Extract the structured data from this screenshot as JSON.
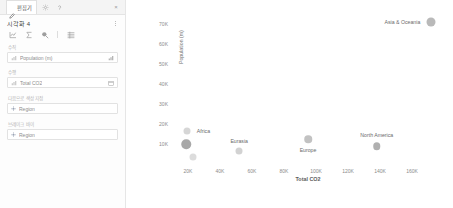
{
  "panel": {
    "tabs": [
      {
        "id": "editor",
        "label": "편집기",
        "icon": "pencil-icon"
      }
    ],
    "tab_buttons": [
      {
        "id": "settings",
        "icon": "gear-icon"
      },
      {
        "id": "help",
        "icon": "question-icon"
      }
    ],
    "close_label": "×",
    "viz_title": "시각화 4",
    "kebab_name": "more-options",
    "tools": [
      {
        "id": "chart-type",
        "icon": "line-chart-icon"
      },
      {
        "id": "aggregate",
        "icon": "sigma-icon"
      },
      {
        "id": "format",
        "icon": "paint-icon"
      },
      {
        "id": "table-view",
        "icon": "table-icon"
      }
    ],
    "fields": [
      {
        "section": "vertical",
        "label": "수직",
        "value": "Population (m)",
        "field_icon": "measure-icon",
        "action_icon": "sort-icon"
      },
      {
        "section": "horizontal",
        "label": "수평",
        "value": "Total CO2",
        "field_icon": "measure-icon",
        "action_icon": "calendar-icon"
      },
      {
        "section": "color-by",
        "label": "다음으로 색상 지정",
        "value": "Region",
        "field_icon": "dimension-icon",
        "action_icon": ""
      },
      {
        "section": "break-by",
        "label": "브레이크 바이",
        "value": "Region",
        "field_icon": "dimension-icon",
        "action_icon": ""
      }
    ]
  },
  "chart_data": {
    "type": "scatter",
    "title": "",
    "xlabel": "Total CO2",
    "ylabel": "Population (m)",
    "xlim": [
      10000,
      180000
    ],
    "ylim": [
      0,
      75000
    ],
    "xticks": [
      "20K",
      "40K",
      "60K",
      "80K",
      "100K",
      "120K",
      "140K",
      "160K"
    ],
    "xtick_values": [
      20000,
      40000,
      60000,
      80000,
      100000,
      120000,
      140000,
      160000
    ],
    "yticks": [
      "10K",
      "20K",
      "30K",
      "40K",
      "50K",
      "60K",
      "70K"
    ],
    "ytick_values": [
      10000,
      20000,
      30000,
      40000,
      50000,
      60000,
      70000
    ],
    "grid": false,
    "legend": "none",
    "point_labels": true,
    "series": [
      {
        "name": "Asia & Oceania",
        "x": 172000,
        "y": 71000,
        "size": 9,
        "color": "#b9b9b9",
        "label": "Asia & Oceania",
        "label_pos": "left"
      },
      {
        "name": "North America",
        "x": 138000,
        "y": 9000,
        "size": 7.5,
        "color": "#b0b0b0",
        "label": "North America",
        "label_pos": "top"
      },
      {
        "name": "Europe",
        "x": 95000,
        "y": 12500,
        "size": 7.5,
        "color": "#c2c2c2",
        "label": "Europe",
        "label_pos": "bottom"
      },
      {
        "name": "Eurasia",
        "x": 52000,
        "y": 6500,
        "size": 7,
        "color": "#d2d2d2",
        "label": "Eurasia",
        "label_pos": "top"
      },
      {
        "name": "Africa",
        "x": 19500,
        "y": 16500,
        "size": 7,
        "color": "#d6d6d6",
        "label": "Africa",
        "label_pos": "right"
      },
      {
        "name": "Middle East",
        "x": 19000,
        "y": 10000,
        "size": 9.5,
        "color": "#a8a8a8",
        "label": "",
        "label_pos": "none"
      },
      {
        "name": "South America",
        "x": 23000,
        "y": 3500,
        "size": 7,
        "color": "#dcdcdc",
        "label": "",
        "label_pos": "none"
      }
    ]
  }
}
